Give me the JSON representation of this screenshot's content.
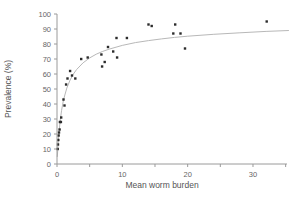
{
  "figure": {
    "background": "#ffffff"
  },
  "chart_data": {
    "type": "scatter",
    "title": "",
    "xlabel": "Mean worm burden",
    "ylabel": "Prevalence (%)",
    "xlim": [
      0,
      35
    ],
    "ylim": [
      0,
      100
    ],
    "x_major_ticks": [
      0,
      10,
      20,
      30
    ],
    "x_minor_ticks": [
      5,
      15,
      25,
      35
    ],
    "y_ticks": [
      0,
      10,
      20,
      30,
      40,
      50,
      60,
      70,
      80,
      90,
      100
    ],
    "grid": false,
    "legend_position": "none",
    "axis_color": "#9a9a9a",
    "text_color": "#666666",
    "series": [
      {
        "name": "observed prevalence",
        "type": "scatter",
        "marker": "square",
        "color": "#2b2b2b",
        "points": [
          [
            0.1,
            10
          ],
          [
            0.15,
            13
          ],
          [
            0.2,
            16
          ],
          [
            0.25,
            19
          ],
          [
            0.3,
            21
          ],
          [
            0.4,
            23
          ],
          [
            0.45,
            28
          ],
          [
            0.6,
            28
          ],
          [
            0.65,
            31
          ],
          [
            1.0,
            43
          ],
          [
            1.15,
            39
          ],
          [
            1.4,
            53
          ],
          [
            1.6,
            57
          ],
          [
            2.0,
            62
          ],
          [
            2.3,
            59
          ],
          [
            2.8,
            57
          ],
          [
            3.7,
            70
          ],
          [
            4.7,
            71
          ],
          [
            6.8,
            73
          ],
          [
            6.9,
            65
          ],
          [
            7.3,
            68
          ],
          [
            7.8,
            78
          ],
          [
            8.6,
            75
          ],
          [
            9.1,
            84
          ],
          [
            9.2,
            71
          ],
          [
            10.7,
            84
          ],
          [
            14.0,
            93
          ],
          [
            14.5,
            92
          ],
          [
            17.8,
            87
          ],
          [
            18.1,
            93
          ],
          [
            18.9,
            87
          ],
          [
            19.6,
            77
          ],
          [
            32.1,
            95
          ]
        ]
      },
      {
        "name": "fitted curve",
        "type": "line",
        "color": "#b8b8b8",
        "points": [
          [
            0.05,
            4.7
          ],
          [
            0.1,
            8.7
          ],
          [
            0.2,
            15.6
          ],
          [
            0.3,
            21.1
          ],
          [
            0.5,
            29.6
          ],
          [
            0.7,
            35.8
          ],
          [
            1.0,
            42.8
          ],
          [
            1.5,
            50.6
          ],
          [
            2.0,
            56.0
          ],
          [
            2.5,
            59.9
          ],
          [
            3.0,
            63.0
          ],
          [
            4.0,
            67.5
          ],
          [
            5.0,
            70.7
          ],
          [
            6.0,
            73.2
          ],
          [
            7.0,
            75.1
          ],
          [
            8.0,
            76.6
          ],
          [
            10,
            79.1
          ],
          [
            12,
            80.9
          ],
          [
            14,
            82.3
          ],
          [
            16,
            83.4
          ],
          [
            18,
            84.4
          ],
          [
            20,
            85.2
          ],
          [
            24,
            86.5
          ],
          [
            28,
            87.5
          ],
          [
            32,
            88.4
          ],
          [
            35.5,
            89.0
          ]
        ]
      }
    ]
  }
}
